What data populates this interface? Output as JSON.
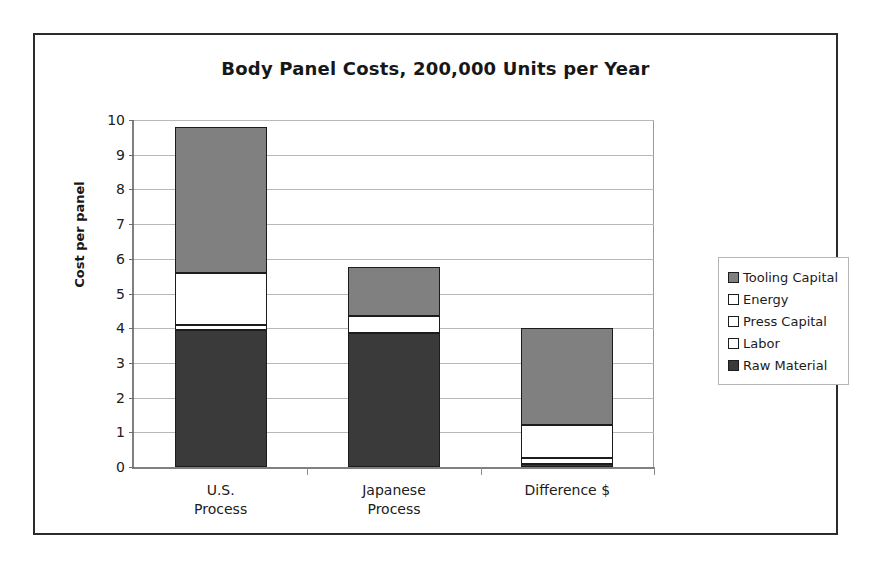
{
  "chart_data": {
    "type": "bar",
    "subtype": "stacked-bar",
    "title": "Body Panel Costs, 200,000 Units per Year",
    "xlabel": "",
    "ylabel": "Cost per panel",
    "ylim": [
      0,
      10
    ],
    "ytick_labels": [
      "0",
      "1",
      "2",
      "3",
      "4",
      "5",
      "6",
      "7",
      "8",
      "9",
      "10"
    ],
    "ytick_values": [
      0,
      1,
      2,
      3,
      4,
      5,
      6,
      7,
      8,
      9,
      10
    ],
    "grid": true,
    "grid_axis": "y",
    "legend_position": "right",
    "categories": [
      "U.S.\nProcess",
      "Japanese\nProcess",
      "Difference $"
    ],
    "category_plain": [
      "U.S. Process",
      "Japanese Process",
      "Difference $"
    ],
    "series": [
      {
        "name": "Raw Material",
        "color": "#3a3a3a",
        "swatch": "#3a3a3a",
        "values": [
          3.95,
          3.85,
          0.1
        ]
      },
      {
        "name": "Labor",
        "color": "#ffffff",
        "swatch": "#ffffff",
        "values": [
          0.15,
          0.0,
          0.15
        ]
      },
      {
        "name": "Press Capital",
        "color": "#ffffff",
        "swatch": "#ffffff",
        "values": [
          0.0,
          0.0,
          0.0
        ]
      },
      {
        "name": "Energy",
        "color": "#ffffff",
        "swatch": "#ffffff",
        "values": [
          1.5,
          0.5,
          0.95
        ]
      },
      {
        "name": "Tooling Capital",
        "color": "#808080",
        "swatch": "#808080",
        "values": [
          4.2,
          1.4,
          2.8
        ]
      }
    ],
    "totals": [
      9.8,
      5.75,
      4.0
    ],
    "legend_order": [
      "Tooling Capital",
      "Energy",
      "Press Capital",
      "Labor",
      "Raw Material"
    ]
  },
  "legend": {
    "items": [
      {
        "label": "Tooling Capital",
        "swatch": "#808080"
      },
      {
        "label": "Energy",
        "swatch": "#ffffff"
      },
      {
        "label": "Press Capital",
        "swatch": "#ffffff"
      },
      {
        "label": "Labor",
        "swatch": "#ffffff"
      },
      {
        "label": "Raw Material",
        "swatch": "#3a3a3a"
      }
    ]
  }
}
